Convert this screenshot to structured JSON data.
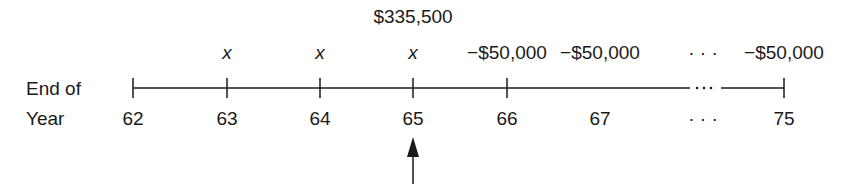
{
  "row_labels": {
    "top": "End of",
    "bottom": "Year"
  },
  "lump_sum": {
    "label": "$335,500",
    "at_year": "65"
  },
  "ticks": [
    {
      "year": "62",
      "x": 133,
      "flow": ""
    },
    {
      "year": "63",
      "x": 227,
      "flow": "x"
    },
    {
      "year": "64",
      "x": 320,
      "flow": "x"
    },
    {
      "year": "65",
      "x": 413,
      "flow": "x"
    },
    {
      "year": "66",
      "x": 507,
      "flow": "−$50,000"
    },
    {
      "year": "67",
      "x": 600,
      "flow": "−$50,000"
    },
    {
      "year": "75",
      "x": 784,
      "flow": "−$50,000"
    }
  ],
  "ellipsis": "· · ·",
  "arrow": {
    "points_to_year": "65"
  },
  "colors": {
    "ink": "#1a1a1a",
    "background": "#ffffff"
  }
}
